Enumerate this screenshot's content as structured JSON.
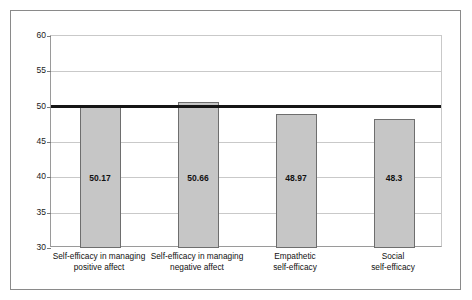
{
  "chart_data": {
    "type": "bar",
    "title": "",
    "subtitle": "",
    "xlabel": "",
    "ylabel": "",
    "ylim": [
      30,
      60
    ],
    "yticks": [
      30,
      35,
      40,
      45,
      50,
      55,
      60
    ],
    "ytick_labels": [
      "30",
      "35",
      "40",
      "45",
      "50",
      "55",
      "60"
    ],
    "grid": "horizontal",
    "legend": "none",
    "categories": [
      "Self-efficacy in managing positive affect",
      "Self-efficacy in managing negative affect",
      "Empathetic self-efficacy",
      "Social self-efficacy"
    ],
    "category_lines": [
      [
        "Self-efficacy in managing",
        "positive affect"
      ],
      [
        "Self-efficacy in managing",
        "negative affect"
      ],
      [
        "Empathetic",
        "self-efficacy"
      ],
      [
        "Social",
        "self-efficacy"
      ]
    ],
    "values": [
      50.17,
      50.66,
      48.97,
      48.3
    ],
    "value_labels": [
      "50.17",
      "50.66",
      "48.97",
      "48.3"
    ],
    "annotations": [
      {
        "name": "reference-line",
        "type": "horizontal-line",
        "value": 50.1,
        "style": "thick-black"
      }
    ],
    "colors": {
      "bar_fill": "#c6c6c6",
      "bar_border": "#6e6e6e",
      "gridline": "#c9c9c9",
      "axis": "#9a9a9a",
      "reference_line": "#151515",
      "text": "#111111",
      "frame": "#8a8a8a",
      "background": "#ffffff"
    }
  }
}
